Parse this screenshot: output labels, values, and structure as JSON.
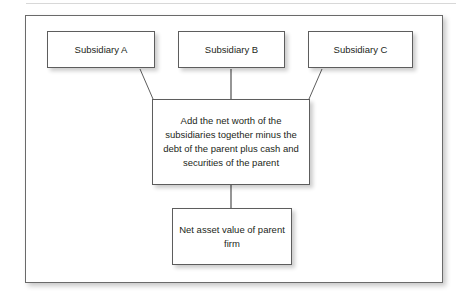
{
  "figure": {
    "type": "flowchart",
    "background_color": "#ffffff",
    "frame_border_color": "#6a6a6a",
    "node_border_color": "#5d5d5d",
    "text_color": "#231f20"
  },
  "nodes": [
    {
      "id": "subsidiary-a",
      "label": "Subsidiary A"
    },
    {
      "id": "subsidiary-b",
      "label": "Subsidiary B"
    },
    {
      "id": "subsidiary-c",
      "label": "Subsidiary C"
    },
    {
      "id": "formula",
      "label": "Add the net worth of the subsidiaries together minus the debt of the parent plus cash and securities of the parent"
    },
    {
      "id": "result",
      "label": "Net asset value of parent firm"
    }
  ],
  "edges": [
    {
      "from": "subsidiary-a",
      "to": "formula",
      "style": "diagonal-line"
    },
    {
      "from": "subsidiary-b",
      "to": "formula",
      "style": "vertical-line"
    },
    {
      "from": "subsidiary-c",
      "to": "formula",
      "style": "diagonal-line"
    },
    {
      "from": "formula",
      "to": "result",
      "style": "vertical-line"
    }
  ]
}
